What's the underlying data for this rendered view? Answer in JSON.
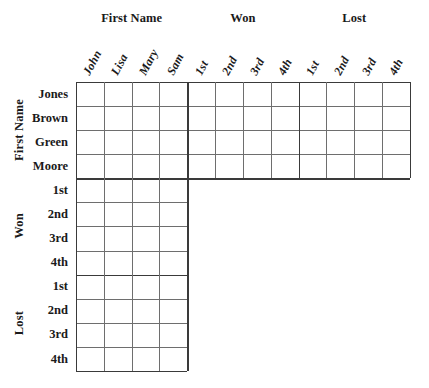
{
  "puzzle": {
    "title": "logic-puzzle-grid",
    "top_groups": [
      {
        "label": "First Name",
        "columns": [
          "John",
          "Lisa",
          "Mary",
          "Sam"
        ]
      },
      {
        "label": "Won",
        "columns": [
          "1st",
          "2nd",
          "3rd",
          "4th"
        ]
      },
      {
        "label": "Lost",
        "columns": [
          "1st",
          "2nd",
          "3rd",
          "4th"
        ]
      }
    ],
    "side_groups": [
      {
        "label": "First Name",
        "rows": [
          "Jones",
          "Brown",
          "Green",
          "Moore"
        ]
      },
      {
        "label": "Won",
        "rows": [
          "1st",
          "2nd",
          "3rd",
          "4th"
        ]
      },
      {
        "label": "Lost",
        "rows": [
          "1st",
          "2nd",
          "3rd",
          "4th"
        ]
      }
    ],
    "grid": {
      "columns": 12,
      "rows": 12,
      "cells_filled": [],
      "shape": "L",
      "full_width_rows": 4,
      "narrow_row_columns": 4
    },
    "colors": {
      "line": "#6e6e6e",
      "line_strong": "#3a3a3a",
      "text": "#1a1a1a",
      "background": "#ffffff"
    }
  }
}
